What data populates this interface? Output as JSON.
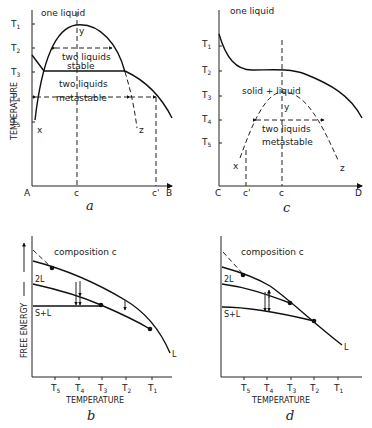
{
  "figure": {
    "panels": [
      {
        "id": "a",
        "label": "a",
        "type": "phase-diagram",
        "region_labels": [
          "one liquid",
          "two liquids stable",
          "two liquids metastable"
        ],
        "region_text": {
          "one_liquid": "one liquid",
          "stable_1": "two liquids",
          "stable_2": "stable",
          "meta_1": "two liquids",
          "meta_2": "metastable"
        },
        "y_axis_label": "TEMPERATURE",
        "y_ticks": [
          "T1",
          "T2",
          "T3",
          "T4",
          "T5"
        ],
        "x_ticks": [
          "A",
          "c",
          "c'",
          "B"
        ],
        "point_labels": {
          "y": "y",
          "x": "x",
          "z": "z"
        }
      },
      {
        "id": "c",
        "label": "c",
        "type": "phase-diagram",
        "region_text": {
          "one_liquid": "one liquid",
          "solid_liquid": "solid + liquid",
          "meta_1": "two liquids",
          "meta_2": "metastable"
        },
        "y_ticks": [
          "T1",
          "T2",
          "T3",
          "T4",
          "T5"
        ],
        "x_ticks": [
          "C",
          "c'",
          "c",
          "D"
        ],
        "point_labels": {
          "y": "y",
          "x": "x",
          "z": "z"
        }
      },
      {
        "id": "b",
        "label": "b",
        "type": "free-energy-plot",
        "title": "composition  c",
        "y_axis_label": "FREE  ENERGY",
        "x_axis_label": "TEMPERATURE",
        "x_ticks": [
          "T5",
          "T4",
          "T3",
          "T2",
          "T1"
        ],
        "curve_labels": {
          "two_liquid": "2L",
          "solid_liquid": "S+L",
          "liquid": "L"
        }
      },
      {
        "id": "d",
        "label": "d",
        "type": "free-energy-plot",
        "title": "composition  c",
        "x_axis_label": "TEMPERATURE",
        "x_ticks": [
          "T5",
          "T4",
          "T3",
          "T2",
          "T1"
        ],
        "curve_labels": {
          "two_liquid": "2L",
          "solid_liquid": "S+L",
          "liquid": "L"
        }
      }
    ]
  }
}
